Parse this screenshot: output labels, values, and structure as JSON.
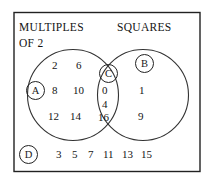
{
  "diagram": {
    "type": "venn-2-set",
    "title_left_line1": "MULTIPLES",
    "title_left_line2": "OF 2",
    "title_right": "SQUARES",
    "regions": {
      "left_only": {
        "tag": "A",
        "set_name": "MULTIPLES OF 2",
        "values": [
          "2",
          "6",
          "8",
          "10",
          "12",
          "14"
        ]
      },
      "right_only": {
        "tag": "B",
        "set_name": "SQUARES",
        "values": [
          "1",
          "9"
        ]
      },
      "intersection": {
        "tag": "C",
        "set_name": "MULTIPLES OF 2 AND SQUARES",
        "values": [
          "0",
          "4",
          "16"
        ]
      },
      "outside": {
        "tag": "D",
        "set_name": "NEITHER",
        "values": [
          "3",
          "5",
          "7",
          "11",
          "13",
          "15"
        ]
      }
    }
  },
  "colors": {
    "stroke": "#222222",
    "text": "#141414",
    "background": "#ffffff"
  }
}
